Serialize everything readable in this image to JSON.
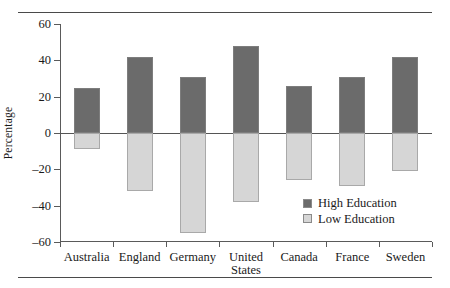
{
  "chart_data": {
    "type": "bar",
    "title": "",
    "subtitle": "",
    "xlabel": "",
    "ylabel": "Percentage",
    "ylim": [
      -60,
      60
    ],
    "yticks": [
      60,
      40,
      20,
      0,
      -20,
      -40,
      -60
    ],
    "ytick_labels": [
      "60",
      "40",
      "20",
      "0",
      "–20",
      "–40",
      "–60"
    ],
    "grid": false,
    "legend_position": "inside-lower-right",
    "categories": [
      "Australia",
      "England",
      "Germany",
      "United\nStates",
      "Canada",
      "France",
      "Sweden"
    ],
    "series": [
      {
        "name": "High Education",
        "color": "#6b6b6b",
        "values": [
          25,
          42,
          31,
          48,
          26,
          31,
          42
        ]
      },
      {
        "name": "Low Education",
        "color": "#d6d6d6",
        "values": [
          -9,
          -32,
          -55,
          -38,
          -26,
          -29,
          -21
        ]
      }
    ]
  },
  "legend": {
    "items": [
      {
        "label": "High Education",
        "swatch": "high"
      },
      {
        "label": "Low Education",
        "swatch": "low"
      }
    ]
  },
  "colors": {
    "high_education": "#6b6b6b",
    "low_education": "#d6d6d6",
    "axis": "#5a5a5a",
    "rule": "#4a4a4a",
    "text": "#1a1a1a"
  }
}
